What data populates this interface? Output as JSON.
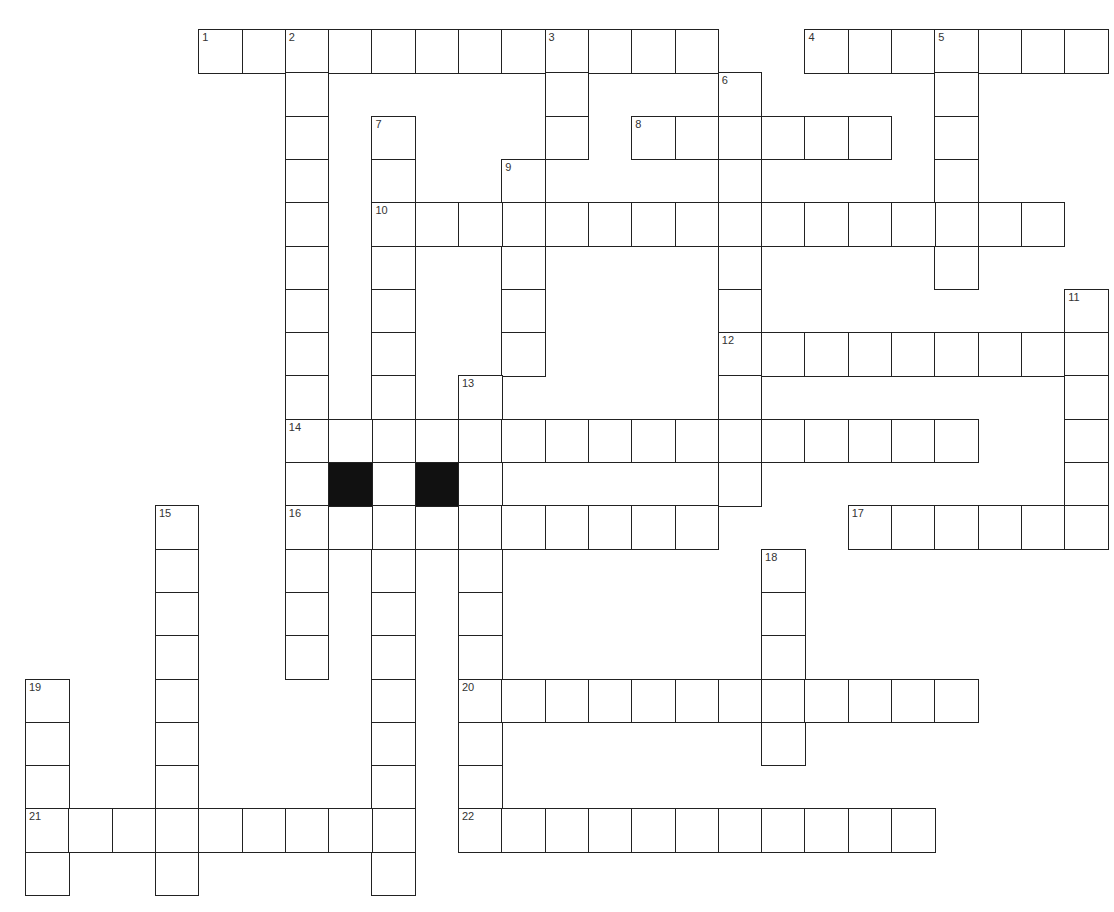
{
  "puzzle": {
    "cell_size": 43.3,
    "origin": {
      "x": 25,
      "y": 29
    },
    "colors": {
      "border": "#222222",
      "fill": "#ffffff",
      "block": "#111111",
      "number": "#333333"
    },
    "blocks": [
      {
        "row": 10,
        "col": 7
      },
      {
        "row": 10,
        "col": 9
      }
    ],
    "words": [
      {
        "number": "1",
        "direction": "across",
        "row": 0,
        "col": 4,
        "length": 12
      },
      {
        "number": "2",
        "direction": "down",
        "row": 0,
        "col": 6,
        "length": 15
      },
      {
        "number": "3",
        "direction": "down",
        "row": 0,
        "col": 12,
        "length": 3
      },
      {
        "number": "4",
        "direction": "across",
        "row": 0,
        "col": 18,
        "length": 7
      },
      {
        "number": "5",
        "direction": "down",
        "row": 0,
        "col": 21,
        "length": 6
      },
      {
        "number": "6",
        "direction": "down",
        "row": 1,
        "col": 16,
        "length": 10
      },
      {
        "number": "7",
        "direction": "down",
        "row": 2,
        "col": 8,
        "length": 18
      },
      {
        "number": "8",
        "direction": "across",
        "row": 2,
        "col": 14,
        "length": 6
      },
      {
        "number": "9",
        "direction": "down",
        "row": 3,
        "col": 11,
        "length": 5
      },
      {
        "number": "10",
        "direction": "across",
        "row": 4,
        "col": 8,
        "length": 16
      },
      {
        "number": "11",
        "direction": "down",
        "row": 6,
        "col": 24,
        "length": 6
      },
      {
        "number": "12",
        "direction": "across",
        "row": 7,
        "col": 16,
        "length": 9
      },
      {
        "number": "13",
        "direction": "down",
        "row": 8,
        "col": 10,
        "length": 11
      },
      {
        "number": "14",
        "direction": "across",
        "row": 9,
        "col": 6,
        "length": 16
      },
      {
        "number": "15",
        "direction": "down",
        "row": 11,
        "col": 3,
        "length": 9
      },
      {
        "number": "16",
        "direction": "across",
        "row": 11,
        "col": 6,
        "length": 10
      },
      {
        "number": "17",
        "direction": "across",
        "row": 11,
        "col": 19,
        "length": 6
      },
      {
        "number": "18",
        "direction": "down",
        "row": 12,
        "col": 17,
        "length": 5
      },
      {
        "number": "19",
        "direction": "down",
        "row": 15,
        "col": 0,
        "length": 5
      },
      {
        "number": "20",
        "direction": "across",
        "row": 15,
        "col": 10,
        "length": 12
      },
      {
        "number": "21",
        "direction": "across",
        "row": 18,
        "col": 0,
        "length": 9
      },
      {
        "number": "22",
        "direction": "across",
        "row": 18,
        "col": 10,
        "length": 11
      }
    ]
  }
}
